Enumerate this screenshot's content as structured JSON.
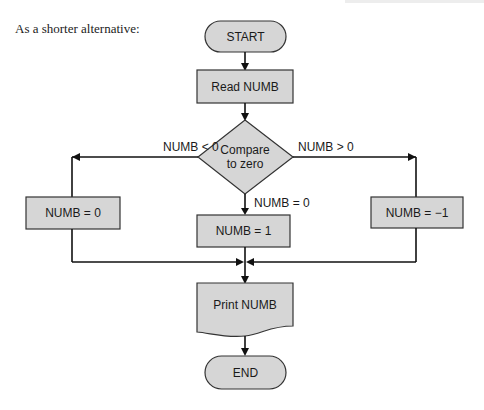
{
  "intro_text": "As a shorter alternative:",
  "flowchart": {
    "start": "START",
    "read": "Read NUMB",
    "decision": {
      "line1": "Compare",
      "line2": "to zero"
    },
    "branch_left_label": "NUMB < 0",
    "branch_right_label": "NUMB > 0",
    "branch_center_label": "NUMB  =  0",
    "left_process": "NUMB  =  0",
    "center_process": "NUMB  =  1",
    "right_process": "NUMB  =  −1",
    "output": "Print NUMB",
    "end": "END"
  },
  "colors": {
    "shape_fill": "#d6d6d6",
    "line": "#111111"
  }
}
